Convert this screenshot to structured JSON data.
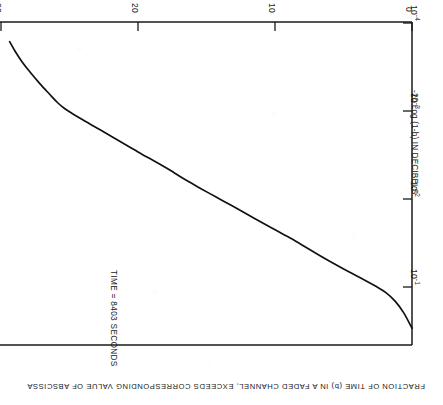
{
  "figure": {
    "annotation": "TIME = 8403 SECONDS",
    "rotation_note": "180",
    "line_color": "#111111",
    "frame_color": "#1a1a1a"
  },
  "chart_data": {
    "type": "line",
    "title": "",
    "subtitle": "",
    "annotations": [
      "TIME = 8403 SECONDS"
    ],
    "xlabel": "-20 Log (1-b) IN DECIBELS",
    "ylabel": "FRACTION OF TIME (b) IN A FADED CHANNEL, EXCEEDS  CORRESPONDING VALUE OF ABSCISSA",
    "xlim": [
      0,
      30
    ],
    "ylim": [
      0.0001,
      1
    ],
    "yscale": "log",
    "xscale": "linear",
    "grid": false,
    "legend": null,
    "xticks": [
      0,
      10,
      20,
      30
    ],
    "xticklabels": [
      "0",
      "10",
      "20",
      "30"
    ],
    "yticks": [
      0.1,
      0.01,
      0.001,
      0.0001
    ],
    "yticklabels": [
      "10-1",
      "10-2",
      "10-3",
      "10-4"
    ],
    "ytick_mantissa": [
      "10",
      "10",
      "10",
      "10"
    ],
    "ytick_exponent": [
      "-1",
      "-2",
      "-3",
      "-4"
    ],
    "series": [
      {
        "name": "fading distribution",
        "x": [
          0.0,
          0.6,
          1.2,
          1.9,
          2.7,
          3.6,
          4.6,
          5.6,
          6.6,
          7.7,
          8.8,
          9.9,
          11.0,
          12.1,
          13.2,
          14.3,
          15.4,
          16.4,
          17.3,
          18.1,
          18.9,
          19.7,
          20.6,
          21.5,
          22.4,
          23.3,
          24.1,
          24.8,
          25.3,
          25.8,
          26.4,
          27.1,
          27.8,
          28.4,
          28.9,
          29.3
        ],
        "y": [
          0.62,
          0.4,
          0.29,
          0.225,
          0.185,
          0.152,
          0.124,
          0.1,
          0.08,
          0.062,
          0.048,
          0.038,
          0.03,
          0.0235,
          0.0185,
          0.0146,
          0.0115,
          0.0092,
          0.0074,
          0.0061,
          0.0051,
          0.0043,
          0.0035,
          0.00285,
          0.00232,
          0.0019,
          0.00158,
          0.00134,
          0.00118,
          0.001,
          0.00078,
          0.00058,
          0.00042,
          0.00031,
          0.00023,
          0.000175
        ]
      }
    ]
  },
  "axes": {
    "db": {
      "title": "-20 Log (1-b) IN DECIBELS",
      "ticks": [
        {
          "label": "0",
          "value": 0
        },
        {
          "label": "10",
          "value": 10
        },
        {
          "label": "20",
          "value": 20
        },
        {
          "label": "30",
          "value": 30
        }
      ]
    },
    "fraction": {
      "title": "FRACTION OF TIME (b) IN A FADED CHANNEL, EXCEEDS  CORRESPONDING VALUE OF ABSCISSA",
      "ticks": [
        {
          "mantissa": "10",
          "exponent": "-1",
          "value": 0.1
        },
        {
          "mantissa": "10",
          "exponent": "-2",
          "value": 0.01
        },
        {
          "mantissa": "10",
          "exponent": "-3",
          "value": 0.001
        },
        {
          "mantissa": "10",
          "exponent": "-4",
          "value": 0.0001
        }
      ]
    }
  }
}
